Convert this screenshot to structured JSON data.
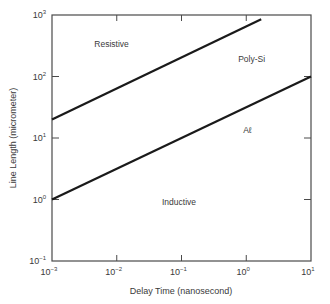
{
  "chart_data": {
    "type": "line",
    "title": "",
    "xlabel": "Delay Time (nanosecond)",
    "ylabel": "Line Length (micrometer)",
    "xscale": "log",
    "yscale": "log",
    "xlim": [
      0.001,
      10
    ],
    "ylim": [
      0.1,
      1000
    ],
    "grid": false,
    "x_ticks": [
      {
        "value": 0.001,
        "base": "10",
        "exp": "−3"
      },
      {
        "value": 0.01,
        "base": "10",
        "exp": "−2"
      },
      {
        "value": 0.1,
        "base": "10",
        "exp": "−1"
      },
      {
        "value": 1,
        "base": "10",
        "exp": "0"
      },
      {
        "value": 10,
        "base": "10",
        "exp": "1"
      }
    ],
    "y_ticks": [
      {
        "value": 1000,
        "base": "10",
        "exp": "3"
      },
      {
        "value": 100,
        "base": "10",
        "exp": "2"
      },
      {
        "value": 10,
        "base": "10",
        "exp": "1"
      },
      {
        "value": 1,
        "base": "10",
        "exp": "0"
      },
      {
        "value": 0.1,
        "base": "10",
        "exp": "−1"
      }
    ],
    "series": [
      {
        "name": "Poly-Si",
        "x": [
          0.001,
          1.7
        ],
        "y": [
          20,
          850
        ],
        "color": "#1a1a1a"
      },
      {
        "name": "Aℓ",
        "x": [
          0.001,
          10
        ],
        "y": [
          1,
          100
        ],
        "color": "#1a1a1a"
      }
    ],
    "annotations": [
      {
        "text": "Resistive",
        "x": 0.0045,
        "y": 300
      },
      {
        "text": "Poly-Si",
        "x": 0.75,
        "y": 170
      },
      {
        "text": "Aℓ",
        "x": 0.9,
        "y": 12
      },
      {
        "text": "Inductive",
        "x": 0.05,
        "y": 0.8
      }
    ],
    "legend": null
  }
}
